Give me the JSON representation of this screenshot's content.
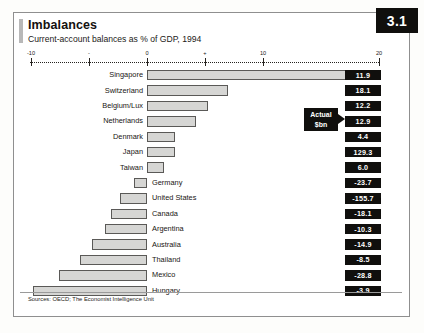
{
  "header": {
    "title": "Imbalances",
    "subtitle": "Current-account balances as % of GDP, 1994",
    "badge": "3.1"
  },
  "callout": {
    "line1": "Actual",
    "line2": "$bn"
  },
  "footer": {
    "source": "Sources: OECD; The Economist Intelligence Unit"
  },
  "colors": {
    "bar_fill": "#d6d6d4",
    "bar_stroke": "#5a5957",
    "badge_bg": "#100f0d",
    "badge_fg": "#ffffff",
    "axis": "#26231f"
  },
  "chart_data": {
    "type": "bar",
    "orientation": "horizontal",
    "title": "Imbalances",
    "subtitle": "Current-account balances as % of GDP, 1994",
    "xlabel": "",
    "ylabel": "",
    "xlim": [
      -10,
      20
    ],
    "grid": false,
    "legend": null,
    "value_column_header": "Actual $bn",
    "tick_labels": [
      "-10",
      "-",
      "0",
      "+",
      "10",
      "20"
    ],
    "tick_values": [
      -10,
      -5,
      0,
      5,
      10,
      20
    ],
    "categories": [
      "Singapore",
      "Switzerland",
      "Belgium/Lux",
      "Netherlands",
      "Denmark",
      "Japan",
      "Taiwan",
      "Germany",
      "United States",
      "Canada",
      "Argentina",
      "Australia",
      "Thailand",
      "Mexico",
      "Hungary"
    ],
    "values": [
      20.0,
      7.0,
      5.3,
      4.2,
      2.4,
      2.4,
      1.5,
      -1.1,
      -2.3,
      -3.1,
      -3.6,
      -4.7,
      -5.8,
      -7.6,
      -9.8
    ],
    "actual_bn": [
      "11.9",
      "18.1",
      "12.2",
      "12.9",
      "4.4",
      "129.3",
      "6.0",
      "-23.7",
      "-155.7",
      "-18.1",
      "-10.3",
      "-14.9",
      "-8.5",
      "-28.8",
      "-3.9"
    ]
  }
}
